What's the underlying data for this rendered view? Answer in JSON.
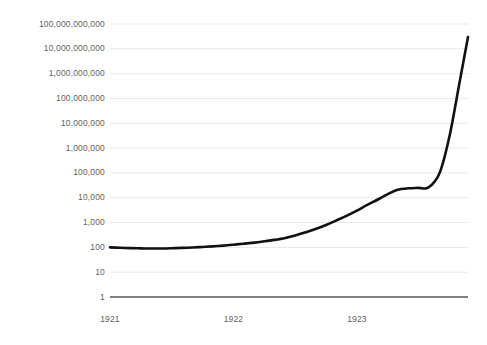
{
  "chart_data": {
    "type": "line",
    "title": "",
    "subtitle": "",
    "xlabel": "",
    "ylabel": "",
    "yscale": "log",
    "ylim": [
      1,
      100000000000
    ],
    "xlim": [
      "1921.0",
      "1923.9"
    ],
    "grid": "horizontal",
    "legend": "none",
    "line_color": "#111111",
    "grid_color": "#e8e8e8",
    "axis_color": "#555555",
    "label_color": "#5f5f5f",
    "background": "#ffffff",
    "ytick_labels": [
      "100,000,000,000",
      "10,000,000,000",
      "1,000,000,000",
      "100,000,000",
      "10,000,000",
      "1,000,000",
      "100,000",
      "10,000",
      "1,000",
      "100",
      "10",
      "1"
    ],
    "ytick_values": [
      100000000000,
      10000000000,
      1000000000,
      100000000,
      10000000,
      1000000,
      100000,
      10000,
      1000,
      100,
      10,
      1
    ],
    "xtick_labels": [
      "1921",
      "1922",
      "1923"
    ],
    "xtick_values": [
      1921,
      1922,
      1923
    ],
    "series": [
      {
        "name": "price index",
        "x": [
          1921.0,
          1921.08,
          1921.17,
          1921.25,
          1921.33,
          1921.42,
          1921.5,
          1921.58,
          1921.67,
          1921.75,
          1921.83,
          1921.92,
          1922.0,
          1922.08,
          1922.17,
          1922.25,
          1922.33,
          1922.42,
          1922.5,
          1922.58,
          1922.67,
          1922.75,
          1922.83,
          1922.92,
          1923.0,
          1923.08,
          1923.17,
          1923.25,
          1923.33,
          1923.42,
          1923.5,
          1923.58,
          1923.67,
          1923.75,
          1923.83,
          1923.9
        ],
        "y": [
          100,
          96,
          93,
          91,
          90,
          90,
          92,
          95,
          99,
          104,
          110,
          118,
          128,
          140,
          155,
          175,
          200,
          240,
          300,
          400,
          560,
          800,
          1200,
          1900,
          3000,
          5000,
          8500,
          14000,
          21000,
          24000,
          25000,
          26000,
          100000,
          3000000,
          400000000,
          30000000000
        ]
      }
    ],
    "annotations": []
  },
  "geometry": {
    "plot_left": 110,
    "plot_right": 468,
    "plot_top": 24,
    "plot_bottom": 297,
    "decade_px": 24.818
  }
}
